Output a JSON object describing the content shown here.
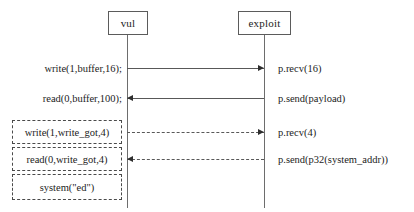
{
  "diagram": {
    "type": "sequence-diagram",
    "participants": [
      {
        "id": "vul",
        "label": "vul"
      },
      {
        "id": "exploit",
        "label": "exploit"
      }
    ],
    "messages": [
      {
        "index": 1,
        "left_label": "write(1,buffer,16);",
        "right_label": "p.recv(16)",
        "direction": "right",
        "style": "solid",
        "boxed": false
      },
      {
        "index": 2,
        "left_label": "read(0,buffer,100);",
        "right_label": "p.send(payload)",
        "direction": "left",
        "style": "solid",
        "boxed": false
      },
      {
        "index": 3,
        "left_label": "write(1,write_got,4)",
        "right_label": "p.recv(4)",
        "direction": "right",
        "style": "dashed",
        "boxed": true
      },
      {
        "index": 4,
        "left_label": "read(0,write_got,4)",
        "right_label": "p.send(p32(system_addr))",
        "direction": "left",
        "style": "dashed",
        "boxed": true
      },
      {
        "index": 5,
        "left_label": "system(\"ed\")",
        "right_label": "",
        "direction": "none",
        "style": "none",
        "boxed": true
      }
    ],
    "colors": {
      "line": "#585858",
      "box_border": "#5b5b5b",
      "dashed_border": "#4a4a4a",
      "text": "#1c1c1c",
      "background": "#ffffff"
    }
  }
}
